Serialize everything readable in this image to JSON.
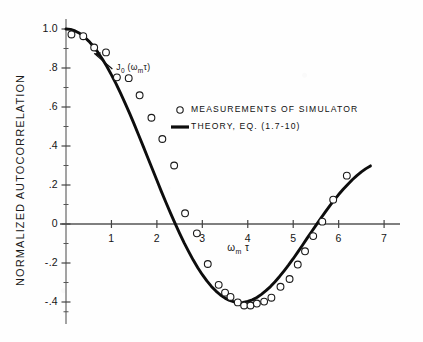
{
  "chart_data": {
    "type": "line",
    "title": "",
    "xlabel": "ωₘ τ",
    "ylabel": "NORMALIZED AUTOCORRELATION",
    "xlim": [
      0,
      7.35
    ],
    "ylim": [
      -0.48,
      1.05
    ],
    "grid": false,
    "x_ticks": [
      "1",
      "2",
      "3",
      "4",
      "5",
      "6",
      "7"
    ],
    "x_tick_values": [
      1,
      2,
      3,
      4,
      5,
      6,
      7
    ],
    "y_ticks": [
      "1.0",
      ".8",
      ".6",
      ".4",
      ".2",
      "0",
      "-.2",
      "-.4"
    ],
    "y_tick_values": [
      1.0,
      0.8,
      0.6,
      0.4,
      0.2,
      0.0,
      -0.2,
      -0.4
    ],
    "y_minor_tick_values": [
      0.9,
      0.7,
      0.5,
      0.3,
      0.1,
      -0.1,
      -0.3,
      -0.45
    ],
    "annotation": "J₀ (ωₘτ)",
    "annotation_x": 1.05,
    "annotation_y": 0.8,
    "legend_position": "upper-right-inside",
    "series": [
      {
        "name": "THEORY, EQ. (1.7-10)",
        "style": "solid-line",
        "x": [
          0.0,
          0.1,
          0.2,
          0.3,
          0.4,
          0.5,
          0.6,
          0.7,
          0.8,
          0.9,
          1.0,
          1.1,
          1.2,
          1.3,
          1.4,
          1.5,
          1.6,
          1.7,
          1.8,
          1.9,
          2.0,
          2.1,
          2.2,
          2.3,
          2.4,
          2.5,
          2.6,
          2.7,
          2.8,
          2.9,
          3.0,
          3.1,
          3.2,
          3.3,
          3.4,
          3.5,
          3.6,
          3.7,
          3.8,
          3.9,
          4.0,
          4.1,
          4.2,
          4.3,
          4.4,
          4.5,
          4.6,
          4.7,
          4.8,
          4.9,
          5.0,
          5.1,
          5.2,
          5.3,
          5.4,
          5.5,
          5.6,
          5.7,
          5.8,
          5.9,
          6.0,
          6.1,
          6.2,
          6.3,
          6.4,
          6.5,
          6.6,
          6.7
        ],
        "values": [
          1.0,
          0.998,
          0.99,
          0.978,
          0.96,
          0.938,
          0.912,
          0.881,
          0.846,
          0.808,
          0.765,
          0.72,
          0.671,
          0.62,
          0.567,
          0.512,
          0.455,
          0.398,
          0.34,
          0.282,
          0.224,
          0.166,
          0.11,
          0.056,
          0.003,
          -0.048,
          -0.097,
          -0.142,
          -0.185,
          -0.224,
          -0.26,
          -0.292,
          -0.32,
          -0.344,
          -0.364,
          -0.38,
          -0.392,
          -0.399,
          -0.403,
          -0.402,
          -0.397,
          -0.389,
          -0.377,
          -0.361,
          -0.342,
          -0.321,
          -0.296,
          -0.269,
          -0.24,
          -0.21,
          -0.178,
          -0.144,
          -0.11,
          -0.075,
          -0.041,
          -0.007,
          0.027,
          0.06,
          0.092,
          0.122,
          0.151,
          0.178,
          0.203,
          0.227,
          0.248,
          0.267,
          0.284,
          0.298
        ]
      },
      {
        "name": "MEASUREMENTS OF SIMULATOR",
        "style": "open-circle-markers",
        "x": [
          0.12,
          0.38,
          0.62,
          0.88,
          1.12,
          1.38,
          1.62,
          1.88,
          2.12,
          2.38,
          2.62,
          2.88,
          3.12,
          3.36,
          3.5,
          3.62,
          3.78,
          3.92,
          4.06,
          4.2,
          4.36,
          4.52,
          4.72,
          4.92,
          5.1,
          5.26,
          5.44,
          5.64,
          5.88,
          6.18
        ],
        "values": [
          0.972,
          0.963,
          0.905,
          0.88,
          0.752,
          0.748,
          0.66,
          0.545,
          0.436,
          0.3,
          0.055,
          -0.048,
          -0.205,
          -0.312,
          -0.352,
          -0.374,
          -0.402,
          -0.418,
          -0.418,
          -0.408,
          -0.398,
          -0.378,
          -0.322,
          -0.282,
          -0.208,
          -0.14,
          -0.062,
          0.012,
          0.125,
          0.248
        ]
      }
    ]
  },
  "legend": {
    "marker_label": "MEASUREMENTS  OF  SIMULATOR",
    "line_label": "THEORY, EQ. (1.7-10)"
  },
  "axes": {
    "y_title": "NORMALIZED  AUTOCORRELATION",
    "x_title_base": "ω",
    "x_title_sub": "m",
    "x_title_tail": "τ"
  },
  "annotation": {
    "base": "J",
    "sub": "0",
    "tail": "(ω",
    "sub2": "m",
    "tail2": "τ)"
  }
}
